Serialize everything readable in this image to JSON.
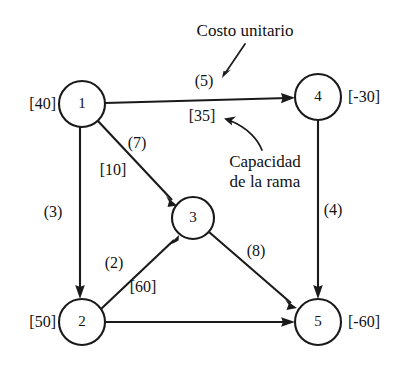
{
  "diagram": {
    "type": "network-flow-diagram",
    "background_color": "#ffffff",
    "ink_color": "#1a1a1a",
    "annotations": [
      {
        "id": "cost-callout",
        "text": "Costo unitario",
        "x": 245,
        "y": 31,
        "points_to": "edge-1-4-cost"
      },
      {
        "id": "capacity-callout-line1",
        "text": "Capacidad",
        "x": 265,
        "y": 162,
        "points_to": "edge-1-4-capacity"
      },
      {
        "id": "capacity-callout-line2",
        "text": "de la rama",
        "x": 265,
        "y": 182,
        "points_to": "edge-1-4-capacity"
      }
    ],
    "nodes": [
      {
        "id": "1",
        "label": "1",
        "x": 82,
        "y": 104,
        "r": 23,
        "supply": "[40]",
        "supply_x": 14,
        "supply_y": 104,
        "supply_side": "left"
      },
      {
        "id": "2",
        "label": "2",
        "x": 82,
        "y": 322,
        "r": 23,
        "supply": "[50]",
        "supply_x": 14,
        "supply_y": 322,
        "supply_side": "left"
      },
      {
        "id": "3",
        "label": "3",
        "x": 193,
        "y": 218,
        "r": 21,
        "supply": "",
        "supply_x": 0,
        "supply_y": 0,
        "supply_side": "none"
      },
      {
        "id": "4",
        "label": "4",
        "x": 318,
        "y": 97,
        "r": 23,
        "supply": "[-30]",
        "supply_x": 348,
        "supply_y": 97,
        "supply_side": "right"
      },
      {
        "id": "5",
        "label": "5",
        "x": 318,
        "y": 322,
        "r": 23,
        "supply": "[-60]",
        "supply_x": 348,
        "supply_y": 322,
        "supply_side": "right"
      }
    ],
    "edges": [
      {
        "id": "edge-1-4",
        "from": "1",
        "to": "4",
        "cost": "(5)",
        "cost_x": 204,
        "cost_y": 81,
        "capacity": "[35]",
        "capacity_x": 202,
        "capacity_y": 116
      },
      {
        "id": "edge-1-3",
        "from": "1",
        "to": "3",
        "cost": "(7)",
        "cost_x": 137,
        "cost_y": 143,
        "capacity": "[10]",
        "capacity_x": 113,
        "capacity_y": 170
      },
      {
        "id": "edge-1-2",
        "from": "1",
        "to": "2",
        "cost": "(3)",
        "cost_x": 53,
        "cost_y": 212,
        "capacity": "",
        "capacity_x": 0,
        "capacity_y": 0
      },
      {
        "id": "edge-2-3",
        "from": "2",
        "to": "3",
        "cost": "(2)",
        "cost_x": 114,
        "cost_y": 263,
        "capacity": "[60]",
        "capacity_x": 143,
        "capacity_y": 287
      },
      {
        "id": "edge-3-5",
        "from": "3",
        "to": "5",
        "cost": "(8)",
        "cost_x": 256,
        "cost_y": 251,
        "capacity": "",
        "capacity_x": 0,
        "capacity_y": 0
      },
      {
        "id": "edge-4-5",
        "from": "4",
        "to": "5",
        "cost": "(4)",
        "cost_x": 333,
        "cost_y": 210,
        "capacity": "",
        "capacity_x": 0,
        "capacity_y": 0
      },
      {
        "id": "edge-2-5",
        "from": "2",
        "to": "5",
        "cost": "",
        "cost_x": 0,
        "cost_y": 0,
        "capacity": "",
        "capacity_x": 0,
        "capacity_y": 0
      }
    ]
  }
}
